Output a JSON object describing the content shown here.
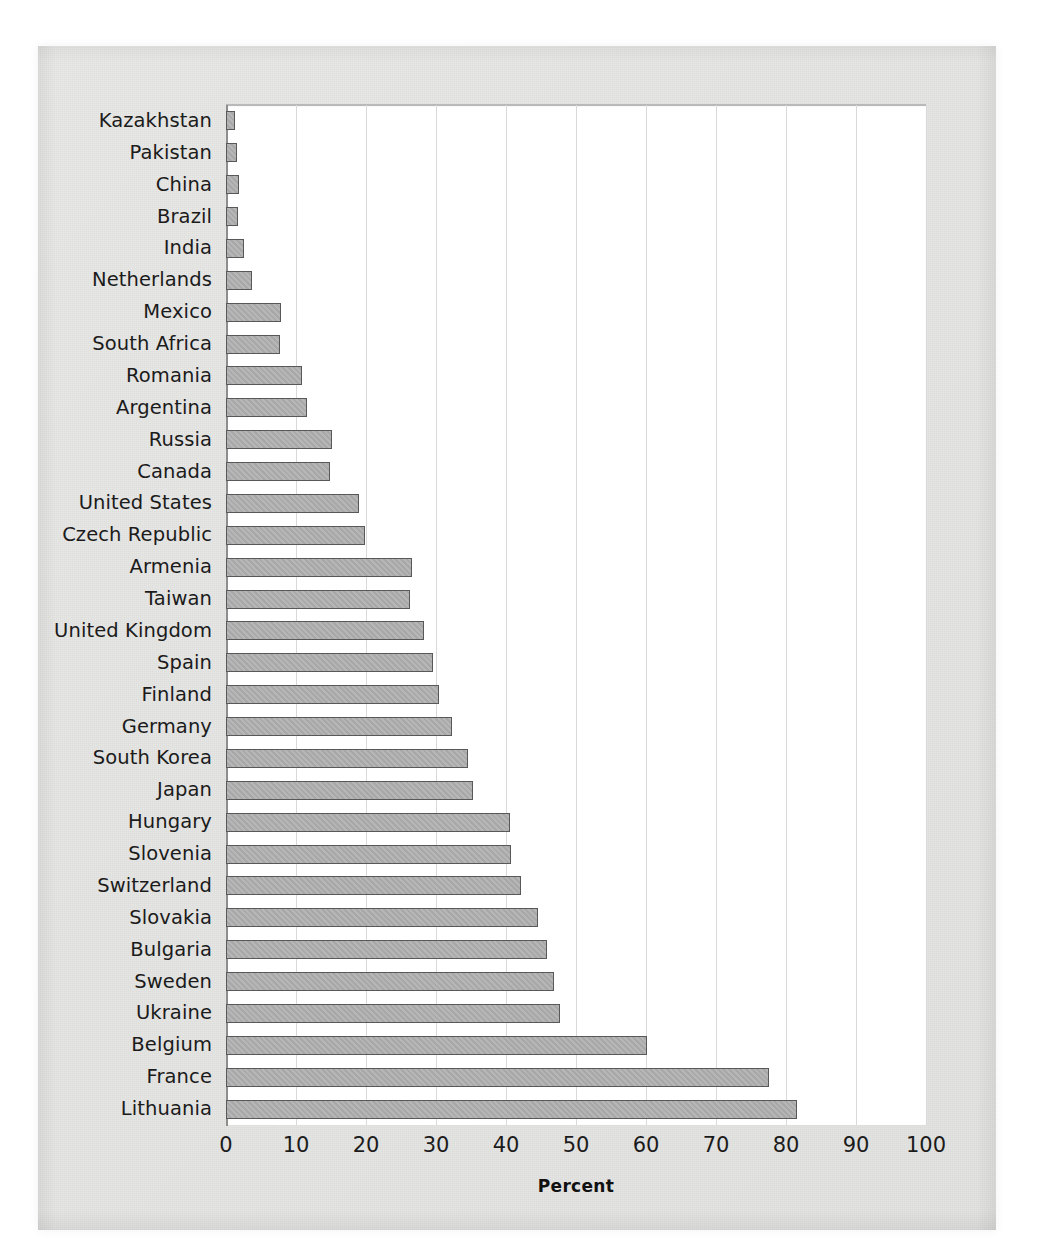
{
  "figure": {
    "axis_title": "Percent",
    "bar_fill": "#a8a8a8",
    "bar_stroke": "#585858",
    "grid_color": "#d9d9d9",
    "page_color": "#e7e7e5",
    "plot_color": "#ffffff"
  },
  "chart_data": {
    "type": "bar",
    "orientation": "horizontal",
    "title": "",
    "xlabel": "Percent",
    "ylabel": "",
    "xlim": [
      0,
      100
    ],
    "xticks": [
      0,
      10,
      20,
      30,
      40,
      50,
      60,
      70,
      80,
      90,
      100
    ],
    "tick_labels": [
      "0",
      "10",
      "20",
      "30",
      "40",
      "50",
      "60",
      "70",
      "80",
      "90",
      "100"
    ],
    "grid": true,
    "grid_axis": "x",
    "legend": "none",
    "categories": [
      "Kazakhstan",
      "Pakistan",
      "China",
      "Brazil",
      "India",
      "Netherlands",
      "Mexico",
      "South Africa",
      "Romania",
      "Argentina",
      "Russia",
      "Canada",
      "United States",
      "Czech Republic",
      "Armenia",
      "Taiwan",
      "United Kingdom",
      "Spain",
      "Finland",
      "Germany",
      "South Korea",
      "Japan",
      "Hungary",
      "Slovenia",
      "Switzerland",
      "Slovakia",
      "Bulgaria",
      "Sweden",
      "Ukraine",
      "Belgium",
      "France",
      "Lithuania"
    ],
    "values": [
      1.3,
      1.6,
      1.8,
      1.7,
      2.5,
      3.7,
      7.8,
      7.7,
      10.8,
      11.5,
      15.2,
      14.8,
      19.0,
      19.8,
      26.5,
      26.3,
      28.3,
      29.6,
      30.4,
      32.3,
      34.6,
      35.3,
      40.6,
      40.7,
      42.1,
      44.6,
      45.8,
      46.9,
      47.7,
      60.2,
      77.6,
      81.6
    ]
  }
}
